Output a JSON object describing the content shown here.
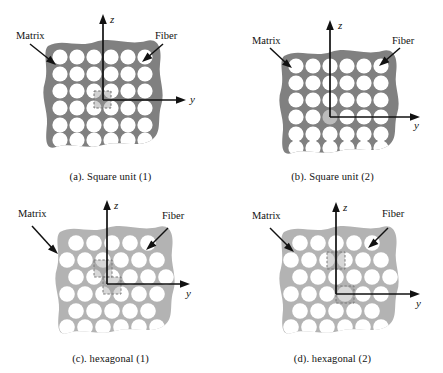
{
  "figure": {
    "type": "composite-microstructure-diagram",
    "panel_count": 4,
    "colors": {
      "matrix_dark": "#808080",
      "matrix_light": "#b3b3b3",
      "fiber": "#ffffff",
      "axis": "#111111",
      "unit_cell_outline": "#8c8c8c",
      "background": "#ffffff"
    }
  },
  "panels": [
    {
      "id": "a",
      "caption": "(a). Square unit (1)",
      "packing": "square",
      "matrix_shade": "dark",
      "rows": 6,
      "cols": 6,
      "origin": "between-fibers",
      "unit_cells": 1,
      "labels": {
        "matrix": "Matrix",
        "fiber": "Fiber",
        "axis_z": "z",
        "axis_y": "y"
      }
    },
    {
      "id": "b",
      "caption": "(b). Square unit (2)",
      "packing": "square",
      "matrix_shade": "dark",
      "rows": 6,
      "cols": 6,
      "origin": "fiber-center",
      "unit_cells": 1,
      "labels": {
        "matrix": "Matrix",
        "fiber": "Fiber",
        "axis_z": "z",
        "axis_y": "y"
      }
    },
    {
      "id": "c",
      "caption": "(c). hexagonal (1)",
      "packing": "hexagonal",
      "matrix_shade": "light",
      "rows": 6,
      "cols": 6,
      "origin": "between-fibers",
      "unit_cells": 2,
      "labels": {
        "matrix": "Matrix",
        "fiber": "Fiber",
        "axis_z": "z",
        "axis_y": "y"
      }
    },
    {
      "id": "d",
      "caption": "(d). hexagonal (2)",
      "packing": "hexagonal",
      "matrix_shade": "light",
      "rows": 6,
      "cols": 6,
      "origin": "fiber-center",
      "unit_cells": 2,
      "labels": {
        "matrix": "Matrix",
        "fiber": "Fiber",
        "axis_z": "z",
        "axis_y": "y"
      }
    }
  ]
}
